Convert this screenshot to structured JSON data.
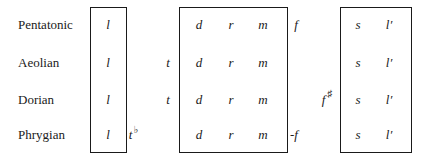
{
  "rows": [
    {
      "mode": "Pentatonic"
    },
    {
      "mode": "Aeolian"
    },
    {
      "mode": "Dorian"
    },
    {
      "mode": "Phrygian"
    }
  ],
  "box1": {
    "notes": [
      "l",
      "l",
      "l",
      "l"
    ]
  },
  "box2": {
    "row0": [
      "d",
      "r",
      "m"
    ],
    "row1": [
      "d",
      "r",
      "m"
    ],
    "row2": [
      "d",
      "r",
      "m"
    ],
    "row3": [
      "d",
      "r",
      "m"
    ]
  },
  "box3": {
    "row0": [
      "s",
      "l′"
    ],
    "row1": [
      "s",
      "l′"
    ],
    "row2": [
      "s",
      "l′"
    ],
    "row3": [
      "s",
      "l′"
    ]
  },
  "outside": {
    "phrygian_tflat": "t",
    "flat_sign": "♭",
    "aeolian_t": "t",
    "dorian_t": "t",
    "pentatonic_f": "f",
    "dorian_f": "f",
    "sharp_sign": "♯",
    "phrygian_f": "-f"
  }
}
